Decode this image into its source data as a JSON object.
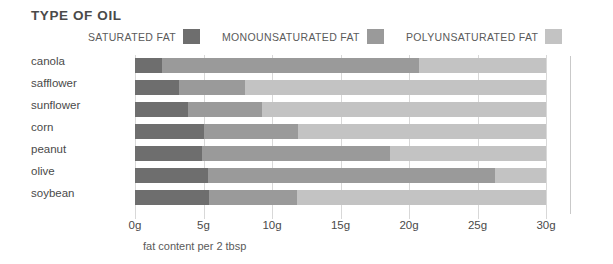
{
  "title": "TYPE OF OIL",
  "caption": "fat content per 2 tbsp",
  "legend": [
    {
      "label": "SATURATED FAT",
      "color": "#6e6e6e"
    },
    {
      "label": "MONOUNSATURATED FAT",
      "color": "#9a9a9a"
    },
    {
      "label": "POLYUNSATURATED FAT",
      "color": "#c3c3c3"
    }
  ],
  "axis": {
    "ticks": [
      "0g",
      "5g",
      "10g",
      "15g",
      "20g",
      "25g",
      "30g"
    ]
  },
  "chart_data": {
    "type": "bar",
    "orientation": "horizontal",
    "stacked": true,
    "title": "TYPE OF OIL",
    "xlabel": "fat content per 2 tbsp",
    "ylabel": "",
    "xlim": [
      0,
      30
    ],
    "xticks": [
      0,
      5,
      10,
      15,
      20,
      25,
      30
    ],
    "xticklabels": [
      "0g",
      "5g",
      "10g",
      "15g",
      "20g",
      "25g",
      "30g"
    ],
    "grid": true,
    "legend_position": "top",
    "categories": [
      "canola",
      "safflower",
      "sunflower",
      "corn",
      "peanut",
      "olive",
      "soybean"
    ],
    "series": [
      {
        "name": "SATURATED FAT",
        "color": "#6e6e6e",
        "values": [
          2.0,
          3.2,
          3.9,
          5.0,
          4.9,
          5.3,
          5.4
        ]
      },
      {
        "name": "MONOUNSATURATED FAT",
        "color": "#9a9a9a",
        "values": [
          18.7,
          4.8,
          5.4,
          6.9,
          13.7,
          21.0,
          6.4
        ]
      },
      {
        "name": "POLYUNSATURATED FAT",
        "color": "#c3c3c3",
        "values": [
          9.3,
          22.0,
          20.7,
          18.1,
          11.4,
          3.7,
          18.2
        ]
      }
    ],
    "totals": [
      30,
      30,
      30,
      30,
      30,
      30,
      30
    ]
  }
}
